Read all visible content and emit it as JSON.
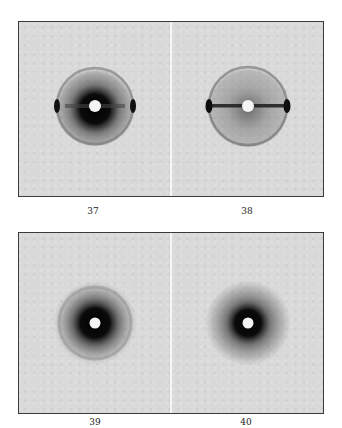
{
  "figures": {
    "top_row": [
      {
        "label": "37",
        "pattern": "ring-with-equatorial-arcs"
      },
      {
        "label": "38",
        "pattern": "ring-with-equatorial-streak"
      }
    ],
    "bottom_row": [
      {
        "label": "39",
        "pattern": "diffuse-halo"
      },
      {
        "label": "40",
        "pattern": "diffuse-halo"
      }
    ]
  },
  "colors": {
    "background": "#d9d9d9",
    "frame": "#3a3a3a",
    "divider": "#f6f6f6",
    "beam_stop": "#f4f4f4",
    "pattern_dark": "#111111"
  }
}
